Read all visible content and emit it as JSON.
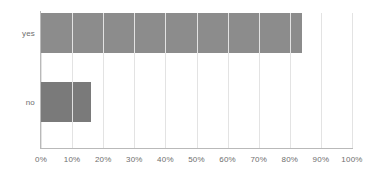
{
  "chart_data": {
    "type": "bar",
    "orientation": "horizontal",
    "title": "",
    "xlabel": "",
    "ylabel": "",
    "categories": [
      "yes",
      "no"
    ],
    "values": [
      84,
      16
    ],
    "value_suffix": "%",
    "xlim": [
      0,
      100
    ],
    "xticks": [
      0,
      10,
      20,
      30,
      40,
      50,
      60,
      70,
      80,
      90,
      100
    ],
    "xtick_labels": [
      "0%",
      "10%",
      "20%",
      "30%",
      "40%",
      "50%",
      "60%",
      "70%",
      "80%",
      "90%",
      "100%"
    ],
    "grid": true,
    "grid_axis": "x",
    "legend": false,
    "legend_position": "none",
    "series": [
      {
        "name": "",
        "values": [
          84,
          16
        ]
      }
    ],
    "bar_colors": [
      "#8c8c8c",
      "#7a7a7a"
    ]
  },
  "style": {
    "background_color": "#ffffff",
    "gridline_color": "#e3e3e3",
    "axis_color": "#b9b9b9",
    "label_color": "#6e6e6e",
    "bar_seam_color": "#f2f2f2"
  }
}
